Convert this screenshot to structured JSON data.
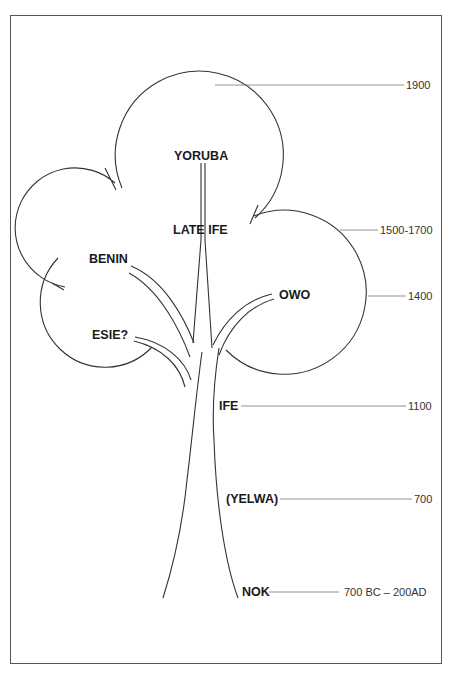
{
  "diagram": {
    "type": "tree-chronology",
    "labels": {
      "yoruba": "YORUBA",
      "late_ife": "LATE IFE",
      "benin": "BENIN",
      "owo": "OWO",
      "esie": "ESIE?",
      "ife": "IFE",
      "yelwa": "(YELWA)",
      "nok": "NOK"
    },
    "dates": {
      "d1900": "1900",
      "d1500_1700": "1500-1700",
      "d1400": "1400",
      "d1100": "1100",
      "d700": "700",
      "d700bc_200ad": "700 BC – 200AD"
    },
    "timeline": [
      {
        "label": "YORUBA",
        "date": "1900"
      },
      {
        "label": "LATE IFE",
        "date": "1500-1700"
      },
      {
        "label": "OWO",
        "date": "1400"
      },
      {
        "label": "IFE",
        "date": "1100"
      },
      {
        "label": "(YELWA)",
        "date": "700"
      },
      {
        "label": "NOK",
        "date": "700 BC – 200AD"
      }
    ],
    "colors": {
      "line": "#333333",
      "text": "#1a1a1a",
      "background": "#ffffff"
    }
  }
}
